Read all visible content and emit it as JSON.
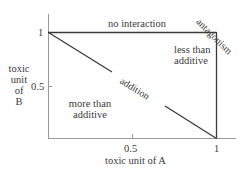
{
  "diagram": {
    "type": "isobologram",
    "x_axis": {
      "label": "toxic unit of A",
      "ticks": [
        "0.5",
        "1"
      ]
    },
    "y_axis": {
      "label_lines": [
        "toxic",
        "unit",
        "of",
        "B"
      ],
      "ticks": [
        "1",
        "0.5"
      ]
    },
    "regions": {
      "no_interaction": "no interaction",
      "antagonism": "antagonism",
      "less_than_additive": [
        "less than",
        "additive"
      ],
      "more_than_additive": [
        "more than",
        "additive"
      ],
      "addition": "addition"
    },
    "colors": {
      "line": "#3a3a3a",
      "axis": "#9a9a9a",
      "text": "#3a3a3a"
    }
  }
}
